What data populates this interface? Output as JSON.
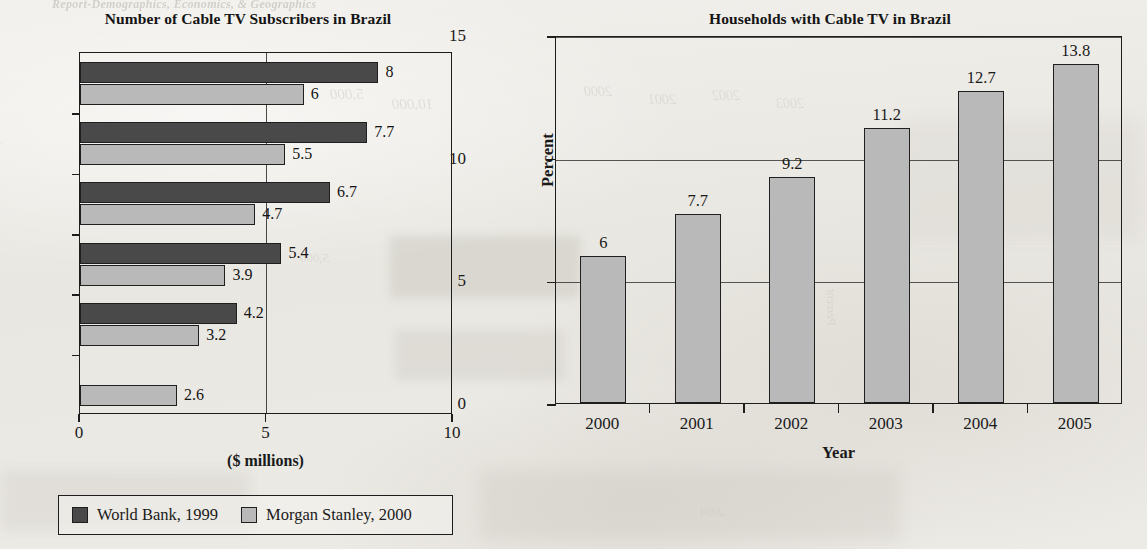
{
  "page": {
    "background_color": "#eceae5",
    "ink_color": "#1a1a1a",
    "bleed_through_text": {
      "header_fragment": "Report-Demographics, Economics, & Geographics",
      "ghost_1": "2000",
      "ghost_2": "2001",
      "ghost_3": "2002",
      "ghost_4": "2003",
      "ghost_5": "2004",
      "ghost_6": "2005",
      "ghost_7": "5,000",
      "ghost_8": "Percent",
      "ghost_9": "10,000",
      "ghost_10": "Number"
    }
  },
  "legend": {
    "series": [
      {
        "label": "World Bank, 1999",
        "color": "#494949"
      },
      {
        "label": "Morgan Stanley, 2000",
        "color": "#b9b9b9"
      }
    ]
  },
  "chart_data": [
    {
      "id": "cable-tv-subscribers",
      "type": "bar",
      "orientation": "horizontal",
      "title": "Number of Cable TV Subscribers in Brazil",
      "xlabel": "($ millions)",
      "ylabel": "",
      "xlim": [
        0,
        10
      ],
      "xticks": [
        0,
        5,
        10
      ],
      "xtick_labels": [
        "0",
        "5",
        "10"
      ],
      "grid": "vertical-at-5",
      "legend_position": "below",
      "categories": [
        "2005",
        "2004",
        "2003",
        "2002",
        "2001",
        "2000"
      ],
      "visible_category_labels": [
        "2004",
        "2002",
        "2000"
      ],
      "series": [
        {
          "name": "World Bank, 1999",
          "color": "#494949",
          "values": [
            8,
            7.7,
            6.7,
            5.4,
            4.2,
            null
          ],
          "value_labels": [
            "8",
            "7.7",
            "6.7",
            "5.4",
            "4.2",
            ""
          ]
        },
        {
          "name": "Morgan Stanley, 2000",
          "color": "#b9b9b9",
          "values": [
            6,
            5.5,
            4.7,
            3.9,
            3.2,
            2.6
          ],
          "value_labels": [
            "6",
            "5.5",
            "4.7",
            "3.9",
            "3.2",
            "2.6"
          ]
        }
      ]
    },
    {
      "id": "households-with-cable-tv",
      "type": "bar",
      "orientation": "vertical",
      "title": "Households with Cable TV in Brazil",
      "xlabel": "Year",
      "ylabel": "Percent",
      "ylim": [
        0,
        15
      ],
      "yticks": [
        0,
        5,
        10,
        15
      ],
      "ytick_labels": [
        "0",
        "5",
        "10",
        "15"
      ],
      "grid": "horizontal",
      "legend_position": "none",
      "categories": [
        "2000",
        "2001",
        "2002",
        "2003",
        "2004",
        "2005"
      ],
      "values": [
        6,
        7.7,
        9.2,
        11.2,
        12.7,
        13.8
      ],
      "value_labels": [
        "6",
        "7.7",
        "9.2",
        "11.2",
        "12.7",
        "13.8"
      ],
      "bar_color": "#b9b9b9"
    }
  ]
}
